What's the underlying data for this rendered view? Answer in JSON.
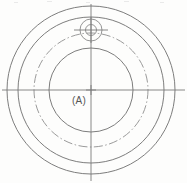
{
  "drawing": {
    "title": "Concentric circle flange end view",
    "background_color": "#fdfdfc",
    "line_color": "#7d7d7d",
    "centerline_color": "#8e8e8e",
    "label_color": "#555555",
    "canvas": {
      "width": 187,
      "height": 183
    },
    "center": {
      "x": 91,
      "y": 90
    },
    "datum_label": "(A)",
    "circles": [
      {
        "name": "outer-rim-circle",
        "radius": 84,
        "style": "solid"
      },
      {
        "name": "middle-rim-circle",
        "radius": 73,
        "style": "solid"
      },
      {
        "name": "bolt-circle",
        "radius": 57,
        "style": "dash-dot"
      },
      {
        "name": "inner-bore-circle",
        "radius": 42,
        "style": "solid"
      }
    ],
    "hole": {
      "name": "bolt-hole",
      "center": {
        "x": 91,
        "y": 30
      },
      "outer_radius": 11,
      "inner_radius": 5.5,
      "crosshair_length": 17
    },
    "centerlines": {
      "horizontal": {
        "x1": 2,
        "y1": 90,
        "x2": 185,
        "y2": 90
      },
      "vertical": {
        "x1": 91,
        "y1": 4,
        "x2": 91,
        "y2": 181
      }
    },
    "center_mark": {
      "size": 5
    }
  },
  "chart_data": {
    "type": "table",
    "categories": [
      "outer-rim-circle",
      "middle-rim-circle",
      "bolt-circle",
      "inner-bore-circle",
      "bolt-hole-outer",
      "bolt-hole-inner"
    ],
    "values": [
      84,
      73,
      57,
      42,
      11,
      5.5
    ],
    "xlabel": "feature",
    "ylabel": "radius (px)",
    "annotations": [
      "(A)"
    ]
  }
}
